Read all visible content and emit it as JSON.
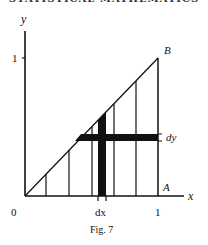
{
  "page": {
    "running_header": "STATISTICAL MATHEMATICS"
  },
  "figure": {
    "caption": "Fig. 7",
    "axes": {
      "x_label": "x",
      "y_label": "y",
      "origin_label": "0",
      "x_tick_label": "1",
      "y_tick_label": "1"
    },
    "points": {
      "A": "A",
      "B": "B"
    },
    "strips": {
      "vertical_label": "dx",
      "horizontal_label": "dy"
    },
    "colors": {
      "ink": "#111111",
      "background": "#ffffff"
    }
  }
}
